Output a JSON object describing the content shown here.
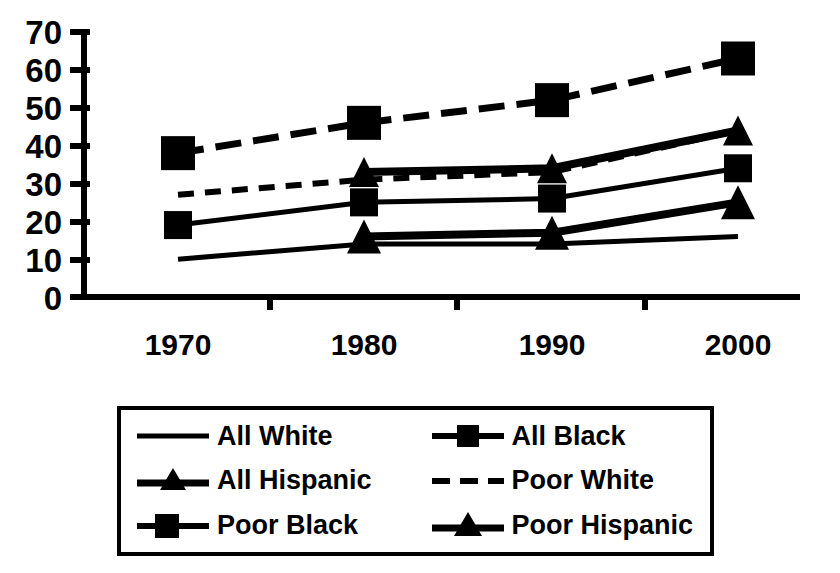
{
  "chart_data": {
    "type": "line",
    "title": "",
    "xlabel": "",
    "ylabel": "",
    "x": [
      1970,
      1980,
      1990,
      2000
    ],
    "categories": [
      "1970",
      "1980",
      "1990",
      "2000"
    ],
    "xlim": [
      1965,
      2005
    ],
    "ylim": [
      0,
      70
    ],
    "ytick_labels": [
      "0",
      "10",
      "20",
      "30",
      "40",
      "50",
      "60",
      "70"
    ],
    "yticks": [
      0,
      10,
      20,
      30,
      40,
      50,
      60,
      70
    ],
    "xtick_labels": [
      "1970",
      "1980",
      "1990",
      "2000"
    ],
    "grid": false,
    "legend_position": "below-plot",
    "series": [
      {
        "name": "All White",
        "marker": "none",
        "line": "solid-thin",
        "x": [
          1970,
          1980,
          1990,
          2000
        ],
        "values": [
          10,
          14,
          14,
          16
        ]
      },
      {
        "name": "All Black",
        "marker": "square",
        "line": "solid-thin",
        "x": [
          1970,
          1980,
          1990,
          2000
        ],
        "values": [
          19,
          25,
          26,
          34
        ]
      },
      {
        "name": "All Hispanic",
        "marker": "triangle",
        "line": "solid-thick",
        "x": [
          1980,
          1990,
          2000
        ],
        "values": [
          33,
          34,
          44
        ]
      },
      {
        "name": "Poor White",
        "marker": "none",
        "line": "dashed",
        "x": [
          1970,
          1980,
          1990,
          2000
        ],
        "values": [
          27,
          31,
          33,
          44
        ]
      },
      {
        "name": "Poor Black",
        "marker": "square",
        "line": "dashed-thick",
        "x": [
          1970,
          1980,
          1990,
          2000
        ],
        "values": [
          38,
          46,
          52,
          63
        ]
      },
      {
        "name": "Poor Hispanic",
        "marker": "triangle",
        "line": "solid-thick",
        "x": [
          1980,
          1990,
          2000
        ],
        "values": [
          16,
          17,
          25
        ]
      }
    ]
  },
  "axis": {
    "y_labels": [
      "70",
      "60",
      "50",
      "40",
      "30",
      "20",
      "10",
      "0"
    ],
    "x_labels": [
      "1970",
      "1980",
      "1990",
      "2000"
    ]
  },
  "legend": {
    "items": [
      {
        "label": "All White",
        "symbol": "line-solid-thin"
      },
      {
        "label": "All  Black",
        "symbol": "line-square"
      },
      {
        "label": "All  Hispanic",
        "symbol": "line-triangle"
      },
      {
        "label": "Poor White",
        "symbol": "line-dashed"
      },
      {
        "label": "Poor  Black",
        "symbol": "line-square-large"
      },
      {
        "label": "Poor  Hispanic",
        "symbol": "line-triangle-large"
      }
    ]
  },
  "colors": {
    "ink": "#000000",
    "background": "#ffffff"
  }
}
